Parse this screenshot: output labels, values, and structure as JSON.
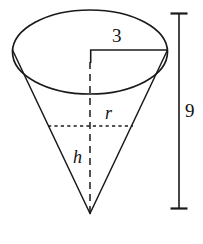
{
  "figure": {
    "stroke_color": "#1a1a1a",
    "background_color": "#ffffff"
  },
  "labels": {
    "top_radius": "3",
    "total_height": "9",
    "radius_symbol": "r",
    "height_symbol": "h"
  },
  "geometry": {
    "ellipse": {
      "center_x": 90,
      "center_y": 52,
      "radius_x": 77.5,
      "radius_y": 42
    },
    "apex": {
      "x": 90,
      "y": 213
    },
    "top_radius_line": {
      "y": 50,
      "x_start": 90,
      "x_end": 167
    },
    "center_axis": {
      "x": 90,
      "y_start": 50,
      "y_end": 213
    },
    "inner_radius_line": {
      "y": 126,
      "x_start": 48,
      "x_end": 133
    },
    "dimension_bar": {
      "x": 179,
      "y_top": 13,
      "y_bottom": 209,
      "tick_half_width": 8
    }
  }
}
